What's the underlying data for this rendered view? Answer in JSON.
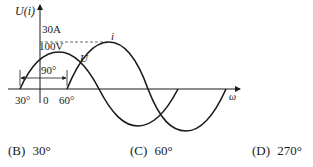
{
  "diagram": {
    "y_axis_label": "U(i)",
    "x_axis_label": "ω",
    "current_amplitude_label": "30A",
    "voltage_amplitude_label": "100V",
    "curve_u_label": "U",
    "curve_i_label": "i",
    "phase_span_label": "90°",
    "tick_left_label": "30°",
    "origin_label": "0",
    "tick_right_label": "60°",
    "curves": [
      {
        "name": "U",
        "description": "voltage sine wave, starts 30° before origin",
        "phase_start_deg": -30,
        "amplitude": "100V"
      },
      {
        "name": "i",
        "description": "current sine wave, starts 60° after origin",
        "phase_start_deg": 60,
        "amplitude": "30A"
      }
    ]
  },
  "options": [
    {
      "key": "(B)",
      "value": "30°"
    },
    {
      "key": "(C)",
      "value": "60°"
    },
    {
      "key": "(D)",
      "value": "270°"
    }
  ]
}
